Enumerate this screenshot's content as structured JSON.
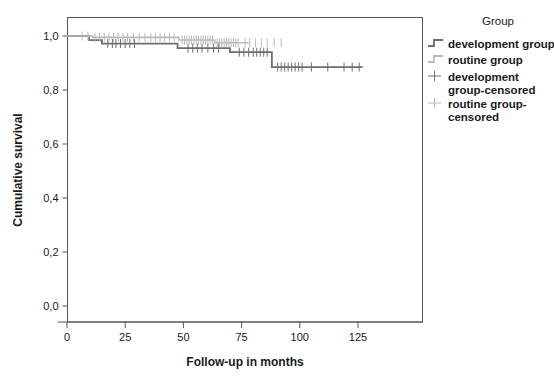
{
  "chart_data": {
    "type": "line",
    "subtype": "kaplan-meier-step",
    "title": "",
    "xlabel": "Follow-up in months",
    "ylabel": "Cumulative survival",
    "xlim": [
      -3,
      132
    ],
    "ylim": [
      0.0,
      1.03
    ],
    "xticks": [
      0,
      25,
      50,
      75,
      100,
      125
    ],
    "xtick_labels": [
      "0",
      "25",
      "50",
      "75",
      "100",
      "125"
    ],
    "yticks": [
      0.0,
      0.2,
      0.4,
      0.6,
      0.8,
      1.0
    ],
    "ytick_labels": [
      "0,0",
      "0,2",
      "0,4",
      "0,6",
      "0,8",
      "1,0"
    ],
    "grid": false,
    "legend_position": "right",
    "legend_title": "Group",
    "series": [
      {
        "name": "development group",
        "color": "#6e6e6e",
        "linewidth": 1.8,
        "steps": [
          [
            0,
            1.0
          ],
          [
            9.5,
            1.0
          ],
          [
            9.5,
            0.985
          ],
          [
            15.0,
            0.985
          ],
          [
            15.0,
            0.972
          ],
          [
            47.5,
            0.972
          ],
          [
            47.5,
            0.955
          ],
          [
            70.0,
            0.955
          ],
          [
            70.0,
            0.94
          ],
          [
            88.0,
            0.94
          ],
          [
            88.0,
            0.885
          ],
          [
            127.0,
            0.885
          ]
        ],
        "censored_times": [
          17.5,
          19.5,
          21.0,
          23.0,
          25.0,
          27.0,
          29.0,
          52.0,
          54.0,
          56.0,
          58.0,
          60.5,
          63.0,
          65.0,
          74.0,
          76.0,
          78.0,
          80.0,
          81.5,
          83.0,
          84.5,
          86.0,
          90.5,
          92.0,
          93.5,
          95.0,
          96.5,
          98.0,
          99.5,
          101.0,
          105.0,
          112.0,
          119.0,
          122.5,
          125.5
        ]
      },
      {
        "name": "routine group",
        "color": "#b9b9b9",
        "linewidth": 1.6,
        "steps": [
          [
            0,
            1.0
          ],
          [
            11.0,
            1.0
          ],
          [
            11.0,
            0.995
          ],
          [
            48.0,
            0.995
          ],
          [
            48.0,
            0.985
          ],
          [
            63.5,
            0.985
          ],
          [
            63.5,
            0.975
          ],
          [
            78.0,
            0.975
          ]
        ],
        "censored_times": [
          6.5,
          9.0,
          12.0,
          14.0,
          16.0,
          18.0,
          20.0,
          22.0,
          24.0,
          26.0,
          28.5,
          31.0,
          33.5,
          36.0,
          38.0,
          40.0,
          42.0,
          44.0,
          46.0,
          49.5,
          50.5,
          51.5,
          52.5,
          53.5,
          54.5,
          55.5,
          56.5,
          57.5,
          58.5,
          59.5,
          60.5,
          61.5,
          62.5,
          64.5,
          65.5,
          66.5,
          67.5,
          68.5,
          69.5,
          70.5,
          71.5,
          72.5,
          73.5,
          76.5,
          78.5,
          81.0,
          83.5,
          86.0,
          89.0,
          92.0
        ]
      }
    ],
    "legend_entries": [
      {
        "label": "development group",
        "kind": "step",
        "color": "#6e6e6e"
      },
      {
        "label": "routine group",
        "kind": "step",
        "color": "#b9b9b9"
      },
      {
        "label": "development group-censored",
        "kind": "censor",
        "color": "#6e6e6e"
      },
      {
        "label": "routine group-censored",
        "kind": "censor",
        "color": "#b9b9b9"
      }
    ]
  },
  "axes": {
    "y_title": "Cumulative survival",
    "x_title": "Follow-up in months",
    "ytick_labels": [
      "1,0",
      "0,8",
      "0,6",
      "0,4",
      "0,2",
      "0,0"
    ],
    "xtick_labels": [
      "0",
      "25",
      "50",
      "75",
      "100",
      "125"
    ]
  },
  "legend": {
    "title": "Group",
    "items": [
      {
        "label": "development group"
      },
      {
        "label": "routine group"
      },
      {
        "label_line1": "development",
        "label_line2": "group-censored"
      },
      {
        "label_line1": "routine group-",
        "label_line2": "censored"
      }
    ]
  },
  "colors": {
    "development": "#6e6e6e",
    "routine": "#b9b9b9",
    "axis": "#555555",
    "text": "#1a1a1a",
    "background": "#ffffff"
  }
}
